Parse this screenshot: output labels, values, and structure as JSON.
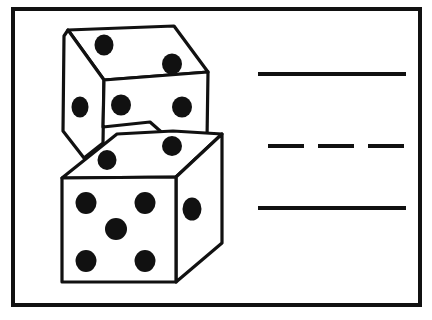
{
  "page": {
    "background_color": "#ffffff",
    "ink_color": "#111111",
    "width": 432,
    "height": 320
  },
  "frame": {
    "name": "outer-border",
    "x": 13,
    "y": 9,
    "width": 407,
    "height": 296,
    "stroke_width": 4,
    "color": "#111111",
    "fill": "#ffffff"
  },
  "illustration": {
    "label": "two-stacked-dice",
    "description": "Line drawing of two white dice stacked at an angle, black pips",
    "outline_color": "#111111",
    "face_fill": "#ffffff",
    "pip_color": "#111111",
    "outline_width": 3.2,
    "upper_die": {
      "label": "upper-die",
      "top_face": {
        "label": "upper-die-top-face",
        "pip_count": 2,
        "polygon": "68,30 174,26 208,72 104,80",
        "pips": [
          {
            "cx": 104,
            "cy": 45,
            "rx": 9.5,
            "ry": 10.5
          },
          {
            "cx": 172,
            "cy": 64,
            "rx": 10.0,
            "ry": 10.5
          }
        ]
      },
      "left_face": {
        "label": "upper-die-left-face",
        "pip_count": 1,
        "polygon": "68,30 104,80 103,143 84,158 63,131 64,36",
        "pips": [
          {
            "cx": 80,
            "cy": 107,
            "rx": 8.5,
            "ry": 10.5
          }
        ]
      },
      "front_face": {
        "label": "upper-die-front-face",
        "pip_count": 2,
        "polygon": "104,80 208,72 207,140 167,137 150,122 103,127",
        "pips": [
          {
            "cx": 121,
            "cy": 105,
            "rx": 10.0,
            "ry": 10.5
          },
          {
            "cx": 182,
            "cy": 107,
            "rx": 10.0,
            "ry": 10.5
          }
        ]
      }
    },
    "lower_die": {
      "label": "lower-die",
      "top_face": {
        "label": "lower-die-top-face",
        "pip_count": 2,
        "polygon": "117,134 173,131 222,134 176,177 62,178",
        "pips": [
          {
            "cx": 107,
            "cy": 160,
            "rx": 9.5,
            "ry": 10.0
          },
          {
            "cx": 172,
            "cy": 146,
            "rx": 10.0,
            "ry": 10.0
          }
        ]
      },
      "front_face": {
        "label": "lower-die-front-face",
        "pip_count": 5,
        "polygon": "62,178 176,177 176,282 62,282",
        "pips": [
          {
            "cx": 86,
            "cy": 203,
            "rx": 10.5,
            "ry": 11.0
          },
          {
            "cx": 145,
            "cy": 203,
            "rx": 10.5,
            "ry": 11.0
          },
          {
            "cx": 116,
            "cy": 229,
            "rx": 11.0,
            "ry": 11.0
          },
          {
            "cx": 86,
            "cy": 261,
            "rx": 10.5,
            "ry": 11.0
          },
          {
            "cx": 145,
            "cy": 261,
            "rx": 10.5,
            "ry": 11.0
          }
        ]
      },
      "right_face": {
        "label": "lower-die-right-face",
        "pip_count": 1,
        "polygon": "176,177 222,134 222,243 176,282",
        "pips": [
          {
            "cx": 192,
            "cy": 209,
            "rx": 9.5,
            "ry": 11.5
          }
        ]
      }
    }
  },
  "answer_lines": [
    {
      "label": "answer-line-top",
      "style": "solid",
      "x1": 258,
      "x2": 406,
      "y": 74,
      "thickness": 4
    },
    {
      "label": "answer-line-middle",
      "style": "dashed",
      "x1": 268,
      "x2": 406,
      "y": 146,
      "thickness": 4,
      "dash_pattern": "36 14"
    },
    {
      "label": "answer-line-bottom",
      "style": "solid",
      "x1": 258,
      "x2": 406,
      "y": 208,
      "thickness": 4
    }
  ]
}
